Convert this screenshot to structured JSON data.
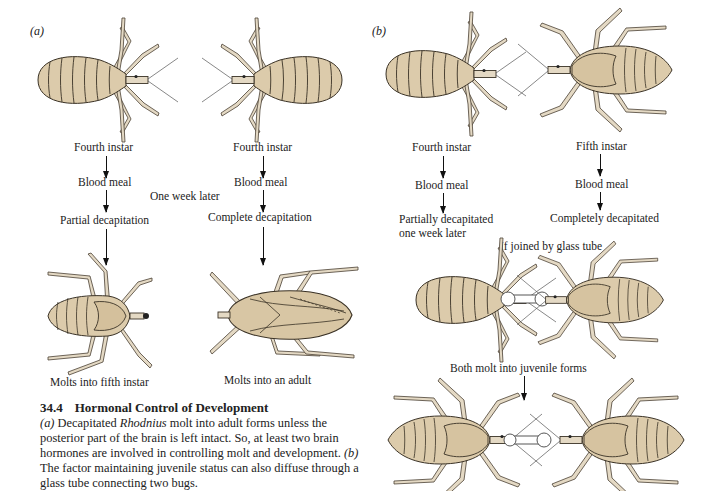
{
  "figure": {
    "number": "34.4",
    "title": "Hormonal Control of Development",
    "caption": {
      "part_a_label": "(a)",
      "part_a_text_1": "Decapitated",
      "part_a_species": "Rhodnius",
      "part_a_text_2": "molt into adult forms unless the posterior part of the brain is left intact. So, at least two brain hormones are involved in controlling molt and development.",
      "part_b_label": "(b)",
      "part_b_text": "The factor maintaining juvenile status can also diffuse through a glass tube connecting two bugs."
    }
  },
  "panel_a": {
    "label": "(a)",
    "left_column": {
      "steps": [
        "Fourth instar",
        "Blood meal",
        "Partial decapitation"
      ],
      "outcome": "Molts into fifth instar"
    },
    "middle_note": "One week later",
    "right_column": {
      "steps": [
        "Fourth instar",
        "Blood meal",
        "Complete decapitation"
      ],
      "outcome": "Molts into an adult"
    }
  },
  "panel_b": {
    "label": "(b)",
    "left_column": {
      "steps": [
        "Fourth instar",
        "Blood meal",
        "Partially decapitated",
        "one week later"
      ]
    },
    "right_column": {
      "steps": [
        "Fifth instar",
        "Blood meal",
        "Completely decapitated"
      ]
    },
    "join_label": "If joined by glass tube",
    "result_label": "Both molt into juvenile forms"
  },
  "colors": {
    "body_fill": "#dccbab",
    "outline": "#3a3226",
    "leg_fill": "#e2d6c0",
    "text": "#222222"
  }
}
